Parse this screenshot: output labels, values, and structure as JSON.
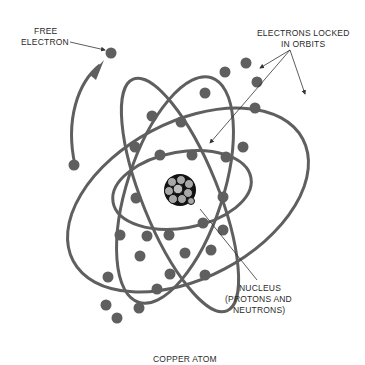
{
  "diagram": {
    "title": "COPPER ATOM",
    "labels": {
      "free_electron_line1": "FREE",
      "free_electron_line2": "ELECTRON",
      "orbits_line1": "ELECTRONS LOCKED",
      "orbits_line2": "IN ORBITS",
      "nucleus_line1": "NUCLEUS",
      "nucleus_line2": "(PROTONS AND",
      "nucleus_line3": "NEUTRONS)"
    },
    "colors": {
      "orbit": "#5f5f5f",
      "electron": "#5f5f5f",
      "nucleus_outline": "#111111",
      "nucleus_fill": "#a8a8a8",
      "text": "#2a2a2a"
    },
    "components": [
      "free electron",
      "electron orbits",
      "nucleus"
    ]
  }
}
